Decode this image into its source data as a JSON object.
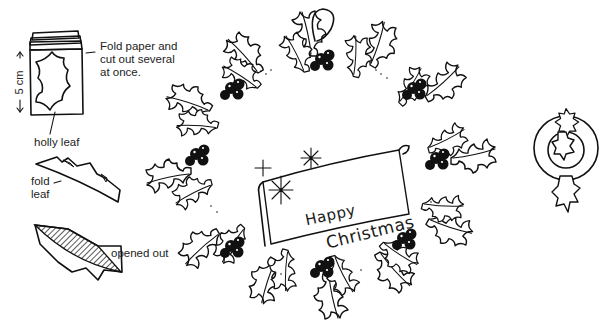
{
  "instructions": {
    "step1_label": "Fold paper and\ncut out several\nat once.",
    "step1_line1": "Fold paper and",
    "step1_line2": "cut out several",
    "step1_line3": "at once.",
    "dimension_label": "← 5 cm →",
    "dimension_value": "5 cm",
    "holly_leaf_label": "holly leaf",
    "fold_label_line1": "fold",
    "fold_label_line2": "leaf",
    "opened_label": "opened out"
  },
  "wreath": {
    "banner_line1": "Happy",
    "banner_line2": "Christmas",
    "berry_clusters": 8
  },
  "ornament": {
    "description": "ring with holly leaves top, center and bottom"
  },
  "colors": {
    "ink": "#111111",
    "paper": "#ffffff"
  }
}
